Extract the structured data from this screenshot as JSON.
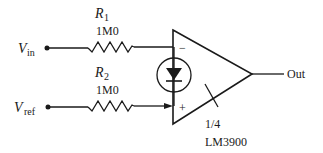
{
  "diagram": {
    "type": "circuit-schematic",
    "inputs": {
      "vin": {
        "main": "V",
        "sub": "in"
      },
      "vref": {
        "main": "V",
        "sub": "ref"
      }
    },
    "resistors": [
      {
        "name": "R",
        "sub": "1",
        "value": "1M0"
      },
      {
        "name": "R",
        "sub": "2",
        "value": "1M0"
      }
    ],
    "opamp": {
      "inverting_sign": "−",
      "noninverting_sign": "+",
      "fraction": "1/4",
      "part": "LM3900"
    },
    "output": {
      "label": "Out"
    }
  }
}
